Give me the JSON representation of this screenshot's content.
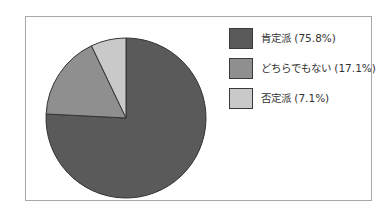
{
  "chart_data": {
    "type": "pie",
    "title": "",
    "categories": [
      "肯定派",
      "どちらでもない",
      "否定派"
    ],
    "values": [
      75.8,
      17.1,
      7.1
    ],
    "unit": "%",
    "colors": [
      "#5a5a5a",
      "#8f8f8f",
      "#c9c9c9"
    ],
    "slice_stroke": "#333333",
    "start_angle_deg": 0,
    "direction": "clockwise",
    "legend_position": "right",
    "legend": {
      "items": [
        {
          "label": "肯定派 (75.8%)"
        },
        {
          "label": "どちらでもない (17.1%)"
        },
        {
          "label": "否定派 (7.1%)"
        }
      ]
    }
  },
  "frame": {
    "border_color": "#a8a8a8",
    "background": "#ffffff"
  }
}
